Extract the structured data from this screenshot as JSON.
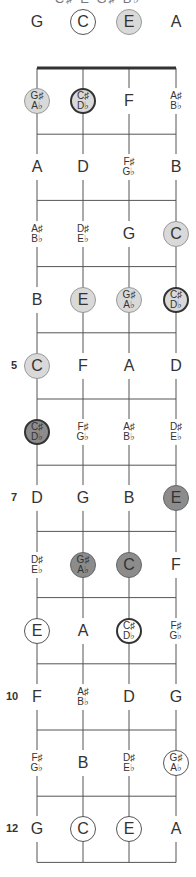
{
  "title": "C♯ E G♯ B♭",
  "strings": [
    "G",
    "C",
    "E",
    "A"
  ],
  "colors": {
    "line": "#555555",
    "nut": "#333333",
    "light": "#d9d9d9",
    "dark": "#8c8c8c"
  },
  "layout": {
    "string_x": [
      37,
      83,
      129,
      176
    ],
    "nut_y": 68,
    "fret_spacing": 66.2,
    "frets": 12,
    "open_y": 22
  },
  "open_row": [
    {
      "label": "G",
      "style": "plain"
    },
    {
      "label": "C",
      "style": "open"
    },
    {
      "label": "E",
      "style": "light"
    },
    {
      "label": "A",
      "style": "plain"
    }
  ],
  "fret_numbers": {
    "5": "5",
    "7": "7",
    "10": "10",
    "12": "12"
  },
  "rows": [
    [
      {
        "label": "G♯|A♭",
        "style": "light"
      },
      {
        "label": "C♯|D♭",
        "style": "lightbold"
      },
      {
        "label": "F",
        "style": "plain"
      },
      {
        "label": "A♯|B♭",
        "style": "plain"
      }
    ],
    [
      {
        "label": "A",
        "style": "plain"
      },
      {
        "label": "D",
        "style": "plain"
      },
      {
        "label": "F♯|G♭",
        "style": "plain"
      },
      {
        "label": "B",
        "style": "plain"
      }
    ],
    [
      {
        "label": "A♯|B♭",
        "style": "plain"
      },
      {
        "label": "D♯|E♭",
        "style": "plain"
      },
      {
        "label": "G",
        "style": "plain"
      },
      {
        "label": "C",
        "style": "light"
      }
    ],
    [
      {
        "label": "B",
        "style": "plain"
      },
      {
        "label": "E",
        "style": "light"
      },
      {
        "label": "G♯|A♭",
        "style": "light"
      },
      {
        "label": "C♯|D♭",
        "style": "lightbold"
      }
    ],
    [
      {
        "label": "C",
        "style": "light"
      },
      {
        "label": "F",
        "style": "plain"
      },
      {
        "label": "A",
        "style": "plain"
      },
      {
        "label": "D",
        "style": "plain"
      }
    ],
    [
      {
        "label": "C♯|D♭",
        "style": "darkbold"
      },
      {
        "label": "F♯|G♭",
        "style": "plain"
      },
      {
        "label": "A♯|B♭",
        "style": "plain"
      },
      {
        "label": "D♯|E♭",
        "style": "plain"
      }
    ],
    [
      {
        "label": "D",
        "style": "plain"
      },
      {
        "label": "G",
        "style": "plain"
      },
      {
        "label": "B",
        "style": "plain"
      },
      {
        "label": "E",
        "style": "dark"
      }
    ],
    [
      {
        "label": "D♯|E♭",
        "style": "plain"
      },
      {
        "label": "G♯|A♭",
        "style": "dark"
      },
      {
        "label": "C",
        "style": "dark"
      },
      {
        "label": "F",
        "style": "plain"
      }
    ],
    [
      {
        "label": "E",
        "style": "open"
      },
      {
        "label": "A",
        "style": "plain"
      },
      {
        "label": "C♯|D♭",
        "style": "openbold"
      },
      {
        "label": "F♯|G♭",
        "style": "plain"
      }
    ],
    [
      {
        "label": "F",
        "style": "plain"
      },
      {
        "label": "A♯|B♭",
        "style": "plain"
      },
      {
        "label": "D",
        "style": "plain"
      },
      {
        "label": "G",
        "style": "plain"
      }
    ],
    [
      {
        "label": "F♯|G♭",
        "style": "plain"
      },
      {
        "label": "B",
        "style": "plain"
      },
      {
        "label": "D♯|E♭",
        "style": "plain"
      },
      {
        "label": "G♯|A♭",
        "style": "open"
      }
    ],
    [
      {
        "label": "G",
        "style": "plain"
      },
      {
        "label": "C",
        "style": "open"
      },
      {
        "label": "E",
        "style": "open"
      },
      {
        "label": "A",
        "style": "plain"
      }
    ]
  ]
}
